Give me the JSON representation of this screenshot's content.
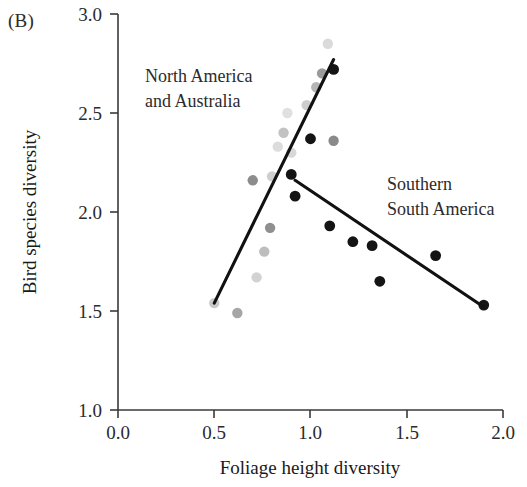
{
  "panel": {
    "label": "(B)"
  },
  "chart_data": {
    "type": "scatter",
    "title": "",
    "xlabel": "Foliage height diversity",
    "ylabel": "Bird species diversity",
    "xlim": [
      0.0,
      2.0
    ],
    "ylim": [
      1.0,
      3.0
    ],
    "xticks": [
      "0.0",
      "0.5",
      "1.0",
      "1.5",
      "2.0"
    ],
    "xtick_values": [
      0.0,
      0.5,
      1.0,
      1.5,
      2.0
    ],
    "yticks": [
      "1.0",
      "1.5",
      "2.0",
      "2.5",
      "3.0"
    ],
    "ytick_values": [
      1.0,
      1.5,
      2.0,
      2.5,
      3.0
    ],
    "grid": false,
    "legend": "annotations-inline",
    "series": [
      {
        "name": "North America and Australia",
        "color": "#b9b9b9",
        "marker": "circle",
        "points": [
          [
            0.5,
            1.54
          ],
          [
            0.62,
            1.49
          ],
          [
            0.72,
            1.67
          ],
          [
            0.76,
            1.8
          ],
          [
            0.79,
            1.92
          ],
          [
            0.7,
            2.16
          ],
          [
            0.8,
            2.18
          ],
          [
            0.83,
            2.33
          ],
          [
            0.86,
            2.4
          ],
          [
            0.9,
            2.3
          ],
          [
            0.88,
            2.5
          ],
          [
            0.98,
            2.54
          ],
          [
            1.03,
            2.63
          ],
          [
            1.06,
            2.7
          ],
          [
            1.09,
            2.85
          ],
          [
            1.12,
            2.36
          ]
        ],
        "trendline": {
          "x1": 0.5,
          "y1": 1.54,
          "x2": 1.12,
          "y2": 2.77
        }
      },
      {
        "name": "Southern South America",
        "color": "#141414",
        "marker": "circle",
        "points": [
          [
            0.9,
            2.19
          ],
          [
            0.92,
            2.08
          ],
          [
            1.0,
            2.37
          ],
          [
            1.12,
            2.72
          ],
          [
            1.1,
            1.93
          ],
          [
            1.22,
            1.85
          ],
          [
            1.32,
            1.83
          ],
          [
            1.36,
            1.65
          ],
          [
            1.65,
            1.78
          ],
          [
            1.9,
            1.53
          ]
        ],
        "trendline": {
          "x1": 0.92,
          "y1": 2.16,
          "x2": 1.9,
          "y2": 1.52
        }
      }
    ],
    "annotations": [
      {
        "text_line1": "North America",
        "text_line2": "and Australia",
        "x": 0.22,
        "y": 2.69
      },
      {
        "text_line1": "Southern",
        "text_line2": "South America",
        "x": 1.4,
        "y": 2.15
      }
    ]
  }
}
